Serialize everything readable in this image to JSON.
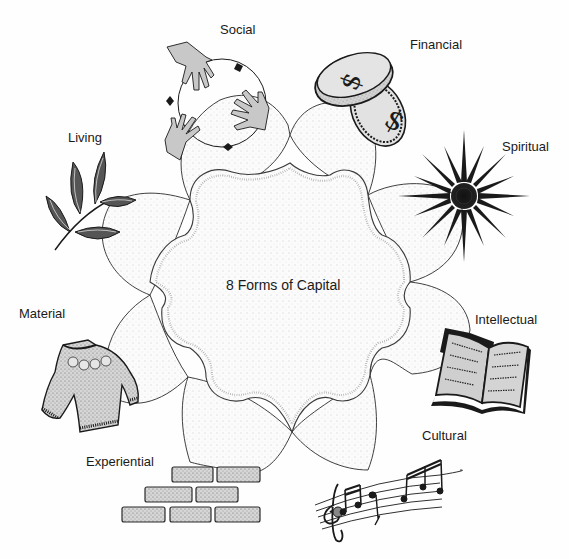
{
  "diagram": {
    "title": "8 Forms of Capital",
    "center_label": "8 Forms of Capital",
    "style": "hand-drawn stippled flower diagram",
    "colors": {
      "ink": "#1a1a1a",
      "stipple_fill": "#f4f4f4",
      "icon_gray": "#c8c8c8",
      "background": "#fefefe"
    },
    "petals": [
      {
        "id": "social",
        "label": "Social",
        "icon": "hands-circle-icon"
      },
      {
        "id": "financial",
        "label": "Financial",
        "icon": "coins-dollar-icon"
      },
      {
        "id": "spiritual",
        "label": "Spiritual",
        "icon": "star-burst-icon"
      },
      {
        "id": "intellectual",
        "label": "Intellectual",
        "icon": "open-book-icon"
      },
      {
        "id": "cultural",
        "label": "Cultural",
        "icon": "music-notes-icon"
      },
      {
        "id": "experiential",
        "label": "Experiential",
        "icon": "brick-wall-icon"
      },
      {
        "id": "material",
        "label": "Material",
        "icon": "sweater-icon"
      },
      {
        "id": "living",
        "label": "Living",
        "icon": "leaf-branch-icon"
      }
    ]
  }
}
